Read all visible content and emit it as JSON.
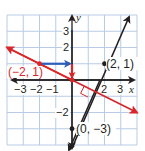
{
  "diagram": {
    "type": "coordinate-plane",
    "grid": {
      "xmin": -4,
      "xmax": 4,
      "ymin": -4,
      "ymax": 4,
      "step": 1
    },
    "colors": {
      "grid": "#b9cbe6",
      "axes": "#231f20",
      "red_line": "#d9262b",
      "blue_arrow": "#2e5cb8",
      "black_line": "#231f20"
    },
    "axes": {
      "x_label": "x",
      "y_label": "y",
      "x_ticks": [
        "−3",
        "−2",
        "−1",
        "2",
        "3"
      ],
      "y_ticks": [
        "3",
        "2",
        "−2"
      ]
    },
    "lines": [
      {
        "name": "red line",
        "equation": "y = -1/2 x",
        "color": "#d9262b"
      },
      {
        "name": "black line",
        "equation": "y = 2x - 3",
        "color": "#231f20"
      }
    ],
    "points": [
      {
        "label": "(−2, 1)",
        "x": -2,
        "y": 1,
        "color": "#d9262b"
      },
      {
        "label": "(2, 1)",
        "x": 2,
        "y": 1,
        "color": "#231f20"
      },
      {
        "label": "(0, −3)",
        "x": 0,
        "y": -3,
        "color": "#231f20"
      }
    ],
    "slope_arrows": [
      {
        "name": "run",
        "from": [
          -2,
          1
        ],
        "to": [
          0,
          1
        ],
        "color": "#2e5cb8"
      },
      {
        "name": "rise",
        "from": [
          0,
          1
        ],
        "to": [
          0,
          0
        ],
        "color": "#d9262b"
      }
    ],
    "right_angle_marker": {
      "at": [
        1.2,
        -0.6
      ]
    }
  }
}
